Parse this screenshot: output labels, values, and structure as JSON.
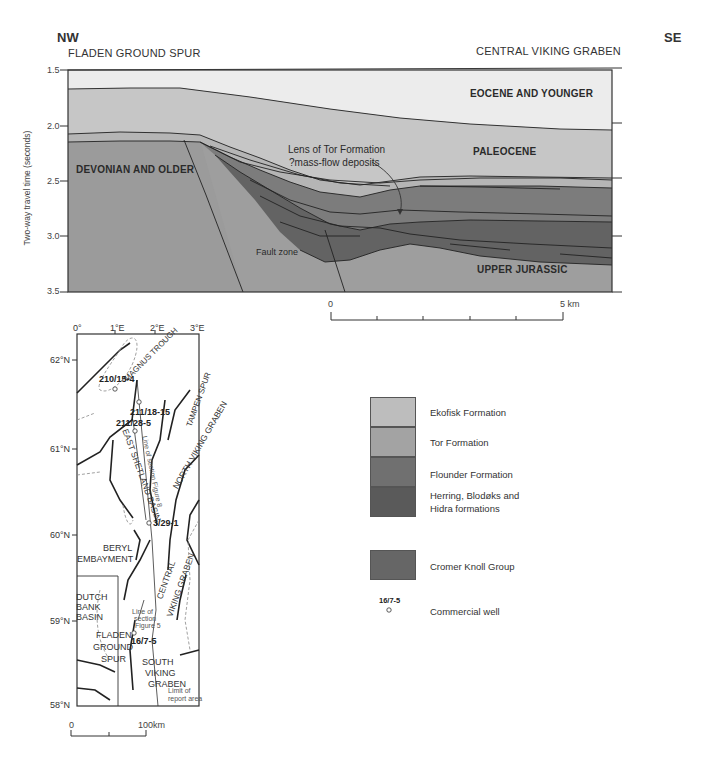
{
  "cross_section": {
    "direction_left": "NW",
    "direction_right": "SE",
    "region_left": "FLADEN GROUND SPUR",
    "region_right": "CENTRAL VIKING GRABEN",
    "y_axis_label": "Two-way travel time (seconds)",
    "y_ticks": [
      "1.5",
      "2.0",
      "2.5",
      "3.0",
      "3.5"
    ],
    "y_range": [
      1.5,
      3.5
    ],
    "unit_labels": {
      "eocene": "EOCENE AND YOUNGER",
      "paleocene": "PALEOCENE",
      "devonian": "DEVONIAN AND OLDER",
      "upper_jurassic": "UPPER JURASSIC",
      "fault_zone": "Fault zone"
    },
    "annotation": {
      "line1": "Lens of Tor Formation",
      "line2": "?mass-flow deposits"
    },
    "scale_bar": {
      "start": "0",
      "end": "5 km",
      "divisions": 5
    }
  },
  "map": {
    "longitude_labels": [
      "0°",
      "1°E",
      "2°E",
      "3°E"
    ],
    "latitude_labels": [
      "62°N",
      "61°N",
      "60°N",
      "59°N",
      "58°N"
    ],
    "features": {
      "magnus_trough": "MAGNUS TROUGH",
      "tampen_spur": "TAMPEN SPUR",
      "east_shetland_basin": "EAST SHETLAND BASIN",
      "north_viking_graben": "NORTH VIKING GRABEN",
      "beryl_line1": "BERYL",
      "beryl_line2": "EMBAYMENT",
      "central_viking_graben_line1": "CENTRAL",
      "central_viking_graben_line2": "VIKING GRABEN",
      "dutch_line1": "DUTCH",
      "dutch_line2": "BANK",
      "dutch_line3": "BASIN",
      "fladen_line1": "FLADEN",
      "fladen_line2": "GROUND",
      "fladen_line3": "SPUR",
      "svg_line1": "SOUTH",
      "svg_line2": "VIKING",
      "svg_line3": "GRABEN",
      "line_of_section_north": "Line of section Figure 8",
      "line_of_section_south_1": "Line of",
      "line_of_section_south_2": "section",
      "line_of_section_south_3": "Figure 5",
      "limit_1": "Limit of",
      "limit_2": "report area"
    },
    "wells": [
      "210/15-4",
      "211/18-15",
      "211/28-5",
      "3/29-1",
      "16/7-5"
    ],
    "scale_bar": {
      "start": "0",
      "end": "100km"
    }
  },
  "legend": {
    "items": [
      {
        "label": "Ekofisk Formation",
        "color": "#bdbdbd"
      },
      {
        "label": "Tor Formation",
        "color": "#a3a3a3"
      },
      {
        "label": "Flounder Formation",
        "color": "#6f6f6f"
      },
      {
        "label_line1": "Herring, Blodøks and",
        "label_line2": "Hidra formations",
        "color": "#5a5a5a"
      },
      {
        "label": "Cromer Knoll Group",
        "color": "#666666"
      }
    ],
    "well_symbol": {
      "example_id": "16/7-5",
      "label": "Commercial well"
    }
  },
  "colors": {
    "eocene": "#ececec",
    "paleocene": "#c8c8c8",
    "ekofisk": "#b8b8b8",
    "tor": "#a6a6a6",
    "flounder": "#7a7a7a",
    "herring": "#5e5e5e",
    "cromer": "#6b6b6b",
    "basement": "#999999",
    "upper_jurassic": "#9a9a9a",
    "line": "#222222"
  }
}
